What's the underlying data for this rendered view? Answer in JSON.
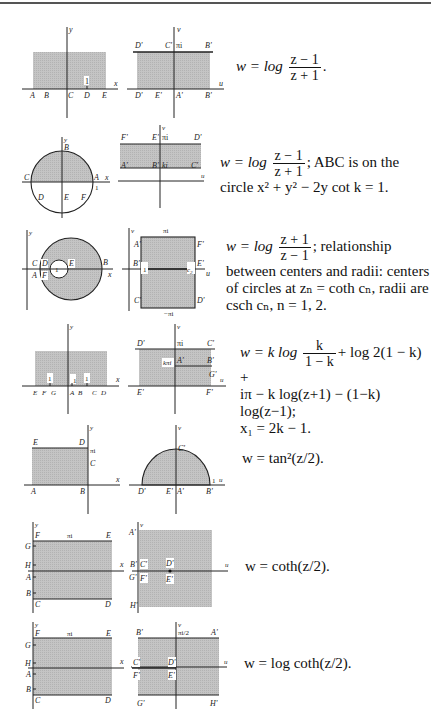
{
  "figures": [
    {
      "id": 1,
      "formula_parts": {
        "lhs": "w = log",
        "num": "z − 1",
        "den": "z + 1",
        "tail": "."
      },
      "z_plane": {
        "axis_x": "x",
        "axis_y": "y",
        "points": [
          "A",
          "B",
          "C",
          "D",
          "E"
        ],
        "marker": "1"
      },
      "w_plane": {
        "axis_x": "u",
        "axis_y": "v",
        "top_labels": [
          "D'",
          "C'",
          "πi",
          "B'"
        ],
        "bottom_labels": [
          "D'",
          "E'",
          "A'",
          "B'"
        ]
      }
    },
    {
      "id": 2,
      "formula_parts": {
        "lhs": "w = log",
        "num": "z − 1",
        "den": "z + 1",
        "tail": "; ABC is on the",
        "line2": "circle x² + y² − 2y cot k = 1."
      },
      "z_plane": {
        "axis_x": "x",
        "axis_y": "y",
        "points": [
          "A",
          "B",
          "C",
          "D",
          "E",
          "F"
        ],
        "marker": "1"
      },
      "w_plane": {
        "axis_x": "u",
        "axis_y": "v",
        "top_labels": [
          "F'",
          "E'",
          "πi",
          "D'"
        ],
        "bottom_labels": [
          "A'",
          "B'",
          "ki",
          "C'"
        ]
      }
    },
    {
      "id": 3,
      "formula_parts": {
        "lhs": "w = log",
        "num": "z + 1",
        "den": "z − 1",
        "tail": "; relationship",
        "line2": "between centers and radii: centers",
        "line3": "of circles at zₙ = coth cₙ, radii are",
        "line4": "csch cₙ, n = 1, 2."
      },
      "z_plane": {
        "axis_x": "x",
        "axis_y": "y",
        "points": [
          "A",
          "B",
          "C",
          "D",
          "E",
          "F"
        ],
        "marker": "1"
      },
      "w_plane": {
        "axis_x": "u",
        "axis_y": "v",
        "top": "πi",
        "bottom": "−πi",
        "labels": [
          "A'",
          "F'",
          "B'",
          "E'",
          "C'",
          "D'"
        ],
        "c1": "1",
        "c2": "c₂"
      }
    },
    {
      "id": 4,
      "formula_parts": {
        "lhs": "w = k log",
        "num": "k",
        "den": "1 − k",
        "tail": "+ log 2(1 − k) +",
        "line2": "iπ − k log(z+1) − (1−k) log(z−1);",
        "line3": "x₁ = 2k − 1."
      },
      "z_plane": {
        "axis_x": "x",
        "axis_y": "y",
        "points": [
          "E",
          "F",
          "G",
          "A",
          "B",
          "C",
          "D"
        ],
        "markers": [
          "1",
          "1",
          "1"
        ]
      },
      "w_plane": {
        "axis_x": "u",
        "axis_y": "v",
        "labels": [
          "D'",
          "πi",
          "C'",
          "A'",
          "kπi",
          "B'",
          "G'",
          "E'",
          "F'"
        ]
      }
    },
    {
      "id": 5,
      "formula_parts": {
        "lhs": "w = tan²(z/2)."
      },
      "z_plane": {
        "axis_x": "x",
        "axis_y": "y",
        "points": [
          "E",
          "D",
          "πi",
          "C",
          "A",
          "B"
        ]
      },
      "w_plane": {
        "axis_x": "u",
        "axis_y": "v",
        "labels": [
          "C'",
          "D'",
          "E'",
          "A'",
          "B'",
          "1"
        ]
      }
    },
    {
      "id": 6,
      "formula_parts": {
        "lhs": "w = coth(z/2)."
      },
      "z_plane": {
        "axis_x": "x",
        "axis_y": "y",
        "points": [
          "F",
          "πi",
          "E",
          "G",
          "H",
          "A",
          "B",
          "C",
          "D"
        ]
      },
      "w_plane": {
        "axis_x": "u",
        "axis_y": "v",
        "labels": [
          "A'",
          "B'",
          "C'",
          "D'",
          "G'",
          "F'",
          "E'",
          "H'"
        ]
      }
    },
    {
      "id": 7,
      "formula_parts": {
        "lhs": "w = log coth(z/2)."
      },
      "z_plane": {
        "axis_x": "x",
        "axis_y": "y",
        "points": [
          "F",
          "πi",
          "E",
          "G",
          "H",
          "A",
          "B",
          "C",
          "D"
        ]
      },
      "w_plane": {
        "axis_x": "u",
        "axis_y": "v",
        "labels": [
          "B'",
          "πi/2",
          "A'",
          "C'",
          "D'",
          "F'",
          "E'",
          "G'",
          "H'"
        ]
      }
    }
  ]
}
